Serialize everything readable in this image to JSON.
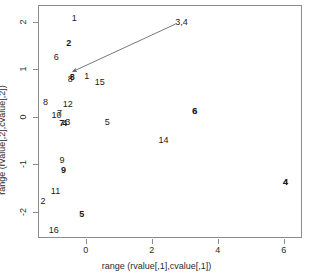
{
  "chart_data": {
    "type": "scatter",
    "title": "",
    "xlabel": "range (rvalue[,1],cvalue[,1])",
    "ylabel": "range (rvalue[,2],cvalue[,2])",
    "xlim": [
      -1.45,
      6.55
    ],
    "ylim": [
      -2.55,
      2.35
    ],
    "xticks": [
      "0",
      "2",
      "4",
      "6"
    ],
    "xtick_values": [
      0,
      2,
      4,
      6
    ],
    "yticks": [
      "2",
      "1",
      "0",
      "-1",
      "-2"
    ],
    "ytick_values": [
      2,
      1,
      0,
      -1,
      -2
    ],
    "grid": false,
    "legend": "none",
    "series": [
      {
        "name": "rows",
        "style": "text-label-regular",
        "points": [
          {
            "label": "1",
            "x": -0.35,
            "y": 2.08
          },
          {
            "label": "6",
            "x": -0.9,
            "y": 1.25
          },
          {
            "label": "8",
            "x": -0.47,
            "y": 0.79
          },
          {
            "label": "1",
            "x": 0.03,
            "y": 0.86
          },
          {
            "label": "15",
            "x": 0.42,
            "y": 0.74
          },
          {
            "label": "8",
            "x": -1.22,
            "y": 0.3
          },
          {
            "label": "12",
            "x": -0.55,
            "y": 0.26
          },
          {
            "label": "10",
            "x": -0.89,
            "y": 0.03
          },
          {
            "label": "7",
            "x": -0.8,
            "y": 0.08
          },
          {
            "label": "3",
            "x": -0.55,
            "y": -0.1
          },
          {
            "label": "5",
            "x": 0.65,
            "y": -0.1
          },
          {
            "label": "6",
            "x": 3.3,
            "y": 0.13
          },
          {
            "label": "14",
            "x": 2.35,
            "y": -0.48
          },
          {
            "label": "9",
            "x": -0.72,
            "y": -0.92
          },
          {
            "label": "11",
            "x": -0.92,
            "y": -1.57
          },
          {
            "label": "2",
            "x": -1.3,
            "y": -1.78
          },
          {
            "label": "16",
            "x": -0.97,
            "y": -2.39
          },
          {
            "label": "4",
            "x": 6.05,
            "y": -1.38
          }
        ]
      },
      {
        "name": "columns",
        "style": "text-label-bold",
        "points": [
          {
            "label": "2",
            "x": -0.52,
            "y": 1.56
          },
          {
            "label": "8",
            "x": -0.41,
            "y": 0.83
          },
          {
            "label": "7",
            "x": -0.73,
            "y": -0.13
          },
          {
            "label": "4",
            "x": -0.64,
            "y": -0.14
          },
          {
            "label": "6",
            "x": 3.3,
            "y": 0.13
          },
          {
            "label": "9",
            "x": -0.68,
            "y": -1.12
          },
          {
            "label": "4",
            "x": 6.05,
            "y": -1.38
          },
          {
            "label": "5",
            "x": -0.12,
            "y": -2.05
          }
        ]
      }
    ],
    "annotations": [
      {
        "label": "3,4",
        "x": 2.9,
        "y": 2.0,
        "style": "text-label-regular",
        "connector": {
          "from_x": 2.72,
          "from_y": 1.95,
          "to_x": -0.4,
          "to_y": 0.95,
          "arrow_at": "to",
          "color": "#555555"
        }
      }
    ]
  }
}
